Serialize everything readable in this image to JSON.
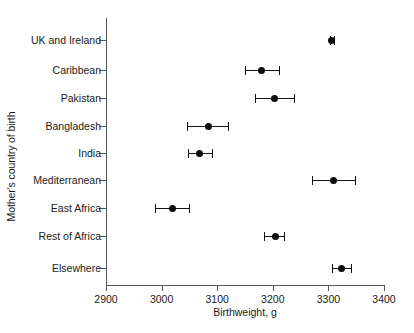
{
  "chart_data": {
    "type": "scatter",
    "title": "",
    "xlabel": "Birthweight, g",
    "ylabel": "Mother's country of birth",
    "xlim": [
      2900,
      3400
    ],
    "xticks": [
      2900,
      3000,
      3100,
      3200,
      3300,
      3400
    ],
    "xticklabels": [
      "2900",
      "3000",
      "3100",
      "3200",
      "3300",
      "3400"
    ],
    "grid": false,
    "legend": null,
    "orientation": "horizontal",
    "marker": "filled-circle",
    "error_bars": "horizontal-confidence-interval",
    "categories": [
      "UK and Ireland",
      "Caribbean",
      "Pakistan",
      "Bangladesh",
      "India",
      "Mediterranean",
      "East Africa",
      "Rest of Africa",
      "Elsewhere"
    ],
    "points": [
      {
        "category": "UK and Ireland",
        "value": 3306,
        "low": 3303,
        "high": 3310
      },
      {
        "category": "Caribbean",
        "value": 3180,
        "low": 3150,
        "high": 3211
      },
      {
        "category": "Pakistan",
        "value": 3203,
        "low": 3168,
        "high": 3238
      },
      {
        "category": "Bangladesh",
        "value": 3084,
        "low": 3045,
        "high": 3120
      },
      {
        "category": "India",
        "value": 3068,
        "low": 3048,
        "high": 3090
      },
      {
        "category": "Mediterranean",
        "value": 3309,
        "low": 3270,
        "high": 3347
      },
      {
        "category": "East Africa",
        "value": 3020,
        "low": 2988,
        "high": 3050
      },
      {
        "category": "Rest of Africa",
        "value": 3205,
        "low": 3184,
        "high": 3221
      },
      {
        "category": "Elsewhere",
        "value": 3323,
        "low": 3307,
        "high": 3341
      }
    ],
    "colors": {
      "marker": "#0d0d0d",
      "error_bar": "#111111",
      "axis": "#555555",
      "text": "#1a1a1a",
      "background": "#ffffff"
    }
  }
}
